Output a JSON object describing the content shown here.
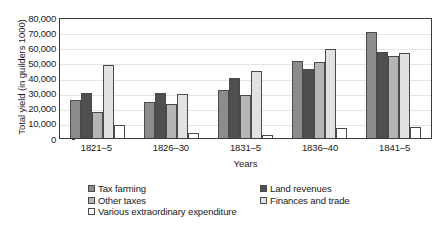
{
  "chart_data": {
    "type": "bar",
    "title": "",
    "xlabel": "Years",
    "ylabel": "Total yield (in guilders 1000)",
    "categories": [
      "1821–5",
      "1826–30",
      "1831–5",
      "1836–40",
      "1841–5"
    ],
    "ylim": [
      0,
      80000
    ],
    "ytick_labels": [
      "80,000",
      "70,000",
      "60,000",
      "50,000",
      "40,000",
      "30,000",
      "20,000",
      "10,000",
      "0"
    ],
    "ytick_values": [
      80000,
      70000,
      60000,
      50000,
      40000,
      30000,
      20000,
      10000,
      0
    ],
    "grid": true,
    "legend_position": "bottom",
    "series": [
      {
        "name": "Tax farming",
        "color": "#8c8c8c",
        "values": [
          25000,
          24000,
          32000,
          51000,
          70000
        ]
      },
      {
        "name": "Land revenues",
        "color": "#4f4f4f",
        "values": [
          29500,
          29500,
          40000,
          45500,
          57000
        ]
      },
      {
        "name": "Other taxes",
        "color": "#b5b5b5",
        "values": [
          17000,
          22500,
          28500,
          50000,
          54500
        ]
      },
      {
        "name": "Finances and trade",
        "color": "#e2e2e2",
        "values": [
          48000,
          29000,
          44000,
          59000,
          56500
        ]
      },
      {
        "name": "Various extraordinary expenditure",
        "color": "#ffffff",
        "values": [
          8500,
          3000,
          2000,
          6500,
          7500
        ]
      }
    ]
  },
  "legend_layout": {
    "row1": [
      "Tax farming",
      "Land revenues"
    ],
    "row2": [
      "Other taxes",
      "Finances and trade"
    ],
    "row3": [
      "Various extraordinary expenditure"
    ]
  },
  "colors": {
    "axis": "#3a3a3a",
    "grid": "#e4e4e4",
    "bar_outline": "#4a4a4a",
    "background": "#ffffff",
    "text": "#1a1a1a"
  }
}
